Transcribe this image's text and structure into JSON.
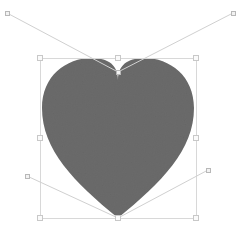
{
  "app": {
    "title": "Vector Editor Canvas",
    "canvas_width": 245,
    "canvas_height": 234,
    "background_color": "#ffffff"
  },
  "shape": {
    "name": "heart",
    "fill_color": "#6b6b6b",
    "texture": "grain",
    "path": "M 118 80 C 118 62 104 58 92 58 C 66 58 42 76 42 108 C 42 150 74 182 118 218 C 162 182 194 150 194 108 C 194 76 170 58 144 58 C 132 58 118 62 118 80 Z",
    "bounds": {
      "x": 40,
      "y": 58,
      "width": 156,
      "height": 160
    }
  },
  "selection": {
    "visible": true,
    "stroke_color": "#d8d8d8",
    "handle_fill": "#fafafa",
    "handle_stroke": "#c8c8c8",
    "box": {
      "x": 40,
      "y": 58,
      "width": 156,
      "height": 160
    },
    "handles": [
      {
        "id": "nw",
        "label": "top-left-resize-handle",
        "x": 40,
        "y": 58
      },
      {
        "id": "n",
        "label": "top-center-resize-handle",
        "x": 118,
        "y": 58
      },
      {
        "id": "ne",
        "label": "top-right-resize-handle",
        "x": 196,
        "y": 58
      },
      {
        "id": "w",
        "label": "middle-left-resize-handle",
        "x": 40,
        "y": 138
      },
      {
        "id": "e",
        "label": "middle-right-resize-handle",
        "x": 196,
        "y": 138
      },
      {
        "id": "sw",
        "label": "bottom-left-resize-handle",
        "x": 40,
        "y": 218
      },
      {
        "id": "s",
        "label": "bottom-center-resize-handle",
        "x": 118,
        "y": 218
      },
      {
        "id": "se",
        "label": "bottom-right-resize-handle",
        "x": 196,
        "y": 218
      }
    ]
  },
  "control_points": {
    "stroke_color": "#d0d0d0",
    "point_fill": "#f2f2f2",
    "point_stroke": "#b8b8b8",
    "anchors": [
      {
        "id": "anchor-top-notch",
        "x": 118,
        "y": 72
      },
      {
        "id": "anchor-bottom-tip",
        "x": 118,
        "y": 218
      }
    ],
    "handles": [
      {
        "id": "handle-top-left",
        "label": "bezier-handle-top-left",
        "x": 7,
        "y": 13,
        "anchor_x": 118,
        "anchor_y": 72
      },
      {
        "id": "handle-top-right",
        "label": "bezier-handle-top-right",
        "x": 233,
        "y": 13,
        "anchor_x": 118,
        "anchor_y": 72
      },
      {
        "id": "handle-bottom-left",
        "label": "bezier-handle-bottom-left",
        "x": 27,
        "y": 176,
        "anchor_x": 118,
        "anchor_y": 218
      },
      {
        "id": "handle-bottom-right",
        "label": "bezier-handle-bottom-right",
        "x": 208,
        "y": 170,
        "anchor_x": 118,
        "anchor_y": 218
      }
    ]
  }
}
